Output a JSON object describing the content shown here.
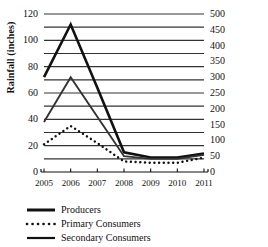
{
  "chart_data": {
    "type": "line",
    "title": "",
    "xlabel": "",
    "ylabel": "Rainfall (inches)",
    "ylabel_right": "Biomass",
    "grid": true,
    "legend_position": "below-left",
    "x": [
      "2005",
      "2006",
      "2007",
      "2008",
      "2009",
      "2010",
      "2011"
    ],
    "categories": [
      "2005",
      "2006",
      "2007",
      "2008",
      "2009",
      "2010",
      "2011"
    ],
    "ylim": [
      0,
      120
    ],
    "ylim_right": [
      0,
      500
    ],
    "yticks": [
      "0",
      "20",
      "40",
      "60",
      "80",
      "100",
      "120"
    ],
    "ytick_values": [
      0,
      20,
      40,
      60,
      80,
      100,
      120
    ],
    "yticks_right": [
      "0",
      "50",
      "100",
      "150",
      "200",
      "250",
      "300",
      "350",
      "400",
      "450",
      "500"
    ],
    "ytick_values_right": [
      0,
      50,
      100,
      150,
      200,
      250,
      300,
      350,
      400,
      450,
      500
    ],
    "gridline_values": [
      10,
      20,
      30,
      40,
      50,
      60,
      70,
      80,
      90,
      100,
      110,
      120
    ],
    "series": [
      {
        "name": "Producers",
        "style": "solid-thick",
        "color": "#111111",
        "values": [
          72,
          112,
          64,
          15,
          11,
          11,
          14
        ]
      },
      {
        "name": "Primary Consumers",
        "style": "dotted",
        "color": "#111111",
        "values": [
          21,
          35,
          22,
          8,
          7,
          7,
          11
        ]
      },
      {
        "name": "Secondary Consumers",
        "style": "solid-medium",
        "color": "#333333",
        "values": [
          38,
          72,
          42,
          12,
          10,
          10,
          13
        ]
      }
    ]
  },
  "legend": {
    "items": [
      {
        "label": "Producers",
        "style": "solid-thick"
      },
      {
        "label": "Primary Consumers",
        "style": "dotted"
      },
      {
        "label": "Secondary Consumers",
        "style": "solid-medium"
      }
    ]
  },
  "colors": {
    "axis": "#111111",
    "grid": "#333333",
    "background": "#ffffff"
  }
}
